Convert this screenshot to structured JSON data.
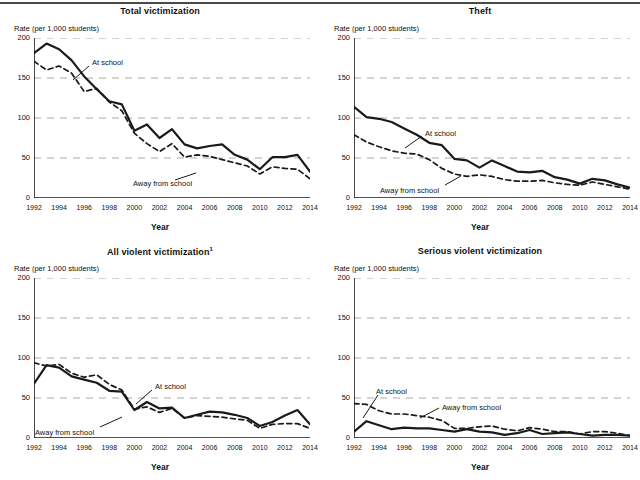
{
  "figure": {
    "y_axis_label": "Rate (per 1,000 students)",
    "x_axis_label": "Year",
    "series_label_at_school": "At school",
    "series_label_away": "Away from school",
    "y_ticks": [
      "200",
      "150",
      "100",
      "50",
      "0"
    ],
    "x_ticks": [
      "1992",
      "1994",
      "1996",
      "1998",
      "2000",
      "2002",
      "2004",
      "2006",
      "2008",
      "2010",
      "2012",
      "2014"
    ],
    "colors": {
      "line": "#1a1a1a",
      "grid": "#a9a9a9",
      "axis": "#1a1a1a",
      "background": "#ffffff"
    }
  },
  "chart_data": [
    {
      "type": "line",
      "title": "Total victimization",
      "xlabel": "Year",
      "ylabel": "Rate (per 1,000 students)",
      "ylim": [
        0,
        200
      ],
      "xlim": [
        1992,
        2014
      ],
      "grid": true,
      "legend": "inline-annotation",
      "x": [
        1992,
        1993,
        1994,
        1995,
        1996,
        1997,
        1998,
        1999,
        2000,
        2001,
        2002,
        2003,
        2004,
        2005,
        2006,
        2007,
        2008,
        2009,
        2010,
        2011,
        2012,
        2013,
        2014
      ],
      "series": [
        {
          "name": "At school",
          "style": "solid",
          "values": [
            181,
            193,
            186,
            172,
            152,
            136,
            121,
            117,
            84,
            92,
            75,
            86,
            67,
            62,
            65,
            67,
            54,
            48,
            36,
            51,
            51,
            54,
            33
          ]
        },
        {
          "name": "Away from school",
          "style": "dashed",
          "values": [
            171,
            160,
            165,
            156,
            133,
            137,
            120,
            109,
            81,
            68,
            58,
            68,
            51,
            54,
            52,
            48,
            44,
            40,
            30,
            39,
            37,
            36,
            24
          ]
        }
      ]
    },
    {
      "type": "line",
      "title": "Theft",
      "xlabel": "Year",
      "ylabel": "Rate (per 1,000 students)",
      "ylim": [
        0,
        200
      ],
      "xlim": [
        1992,
        2014
      ],
      "grid": true,
      "legend": "inline-annotation",
      "x": [
        1992,
        1993,
        1994,
        1995,
        1996,
        1997,
        1998,
        1999,
        2000,
        2001,
        2002,
        2003,
        2004,
        2005,
        2006,
        2007,
        2008,
        2009,
        2010,
        2011,
        2012,
        2013,
        2014
      ],
      "series": [
        {
          "name": "At school",
          "style": "solid",
          "values": [
            114,
            101,
            99,
            95,
            87,
            79,
            69,
            66,
            49,
            47,
            38,
            47,
            40,
            33,
            32,
            34,
            26,
            23,
            18,
            24,
            22,
            17,
            13
          ]
        },
        {
          "name": "Away from school",
          "style": "dashed",
          "values": [
            79,
            70,
            64,
            59,
            56,
            55,
            48,
            37,
            30,
            27,
            29,
            27,
            23,
            21,
            21,
            22,
            19,
            17,
            16,
            20,
            17,
            14,
            11
          ]
        }
      ]
    },
    {
      "type": "line",
      "title": "All violent victimization",
      "title_footnote": "1",
      "xlabel": "Year",
      "ylabel": "Rate (per 1,000 students)",
      "ylim": [
        0,
        200
      ],
      "xlim": [
        1992,
        2014
      ],
      "grid": true,
      "legend": "inline-annotation",
      "x": [
        1992,
        1993,
        1994,
        1995,
        1996,
        1997,
        1998,
        1999,
        2000,
        2001,
        2002,
        2003,
        2004,
        2005,
        2006,
        2007,
        2008,
        2009,
        2010,
        2011,
        2012,
        2013,
        2014
      ],
      "series": [
        {
          "name": "At school",
          "style": "solid",
          "values": [
            68,
            91,
            88,
            77,
            73,
            69,
            59,
            58,
            35,
            45,
            37,
            38,
            25,
            29,
            33,
            32,
            29,
            25,
            15,
            20,
            28,
            35,
            17
          ]
        },
        {
          "name": "Away from school",
          "style": "dashed",
          "values": [
            94,
            90,
            92,
            81,
            76,
            79,
            67,
            60,
            36,
            39,
            32,
            37,
            25,
            28,
            27,
            26,
            24,
            22,
            12,
            17,
            18,
            18,
            12
          ]
        }
      ]
    },
    {
      "type": "line",
      "title": "Serious violent victimization",
      "xlabel": "Year",
      "ylabel": "Rate (per 1,000 students)",
      "ylim": [
        0,
        200
      ],
      "xlim": [
        1992,
        2014
      ],
      "grid": true,
      "legend": "inline-annotation",
      "x": [
        1992,
        1993,
        1994,
        1995,
        1996,
        1997,
        1998,
        1999,
        2000,
        2001,
        2002,
        2003,
        2004,
        2005,
        2006,
        2007,
        2008,
        2009,
        2010,
        2011,
        2012,
        2013,
        2014
      ],
      "series": [
        {
          "name": "At school",
          "style": "solid",
          "values": [
            8,
            21,
            16,
            11,
            13,
            12,
            12,
            10,
            8,
            11,
            8,
            7,
            4,
            6,
            10,
            5,
            6,
            7,
            5,
            3,
            4,
            4,
            3
          ]
        },
        {
          "name": "Away from school",
          "style": "dashed",
          "values": [
            43,
            42,
            34,
            30,
            30,
            28,
            26,
            22,
            12,
            12,
            14,
            15,
            11,
            9,
            13,
            11,
            8,
            8,
            5,
            8,
            8,
            6,
            3
          ]
        }
      ]
    }
  ],
  "annotations": [
    {
      "panel": 0,
      "at_school": {
        "label": "At school",
        "x": 92,
        "y": 58,
        "leader": [
          [
            89,
            66
          ],
          [
            73,
            80
          ]
        ]
      },
      "away": {
        "label": "Away from school",
        "x": 133,
        "y": 179,
        "leader": [
          [
            175,
            180
          ],
          [
            196,
            173
          ]
        ]
      }
    },
    {
      "panel": 1,
      "at_school": {
        "label": "At school",
        "x": 105,
        "y": 129,
        "leader": [
          [
            102,
            136
          ],
          [
            85,
            148
          ]
        ]
      },
      "away": {
        "label": "Away from school",
        "x": 60,
        "y": 186,
        "leader": [
          [
            125,
            185
          ],
          [
            141,
            176
          ]
        ]
      }
    },
    {
      "panel": 2,
      "at_school": {
        "label": "At school",
        "x": 155,
        "y": 142,
        "leader": [
          [
            152,
            150
          ],
          [
            136,
            164
          ]
        ]
      },
      "away": {
        "label": "Away from school",
        "x": 35,
        "y": 188,
        "leader": [
          [
            100,
            187
          ],
          [
            122,
            177
          ]
        ]
      }
    },
    {
      "panel": 3,
      "at_school": {
        "label": "At school",
        "x": 56,
        "y": 147,
        "leader": [
          [
            58,
            155
          ],
          [
            43,
            178
          ]
        ]
      },
      "away": {
        "label": "Away from school",
        "x": 122,
        "y": 163,
        "leader": [
          [
            119,
            168
          ],
          [
            100,
            178
          ]
        ]
      }
    }
  ]
}
